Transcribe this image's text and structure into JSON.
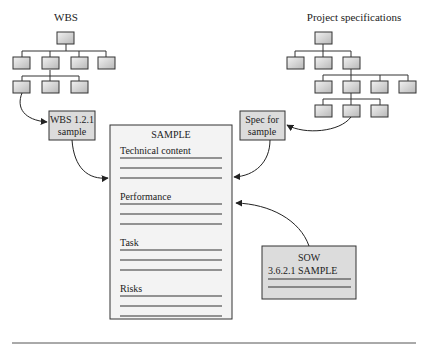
{
  "wbs": {
    "title": "WBS",
    "sample_box": {
      "line1": "WBS 1.2.1",
      "line2": "sample"
    }
  },
  "project_specifications": {
    "title": "Project specifications",
    "sample_box": {
      "line1": "Spec for",
      "line2": "sample"
    }
  },
  "sample_document": {
    "title": "SAMPLE",
    "sections": [
      {
        "label": "Technical content"
      },
      {
        "label": "Performance"
      },
      {
        "label": "Task"
      },
      {
        "label": "Risks"
      }
    ]
  },
  "sow": {
    "title": "SOW",
    "reference": "3.6.2.1 SAMPLE"
  },
  "colors": {
    "box_fill": "#dcdcdc",
    "box_stroke": "#3a3a3a",
    "document_fill": "#f3f3f3",
    "line": "#333333"
  }
}
